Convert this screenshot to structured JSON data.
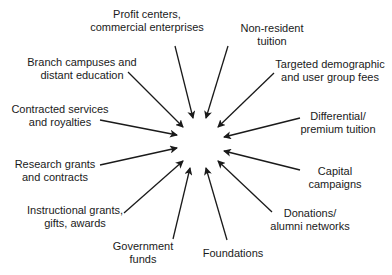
{
  "diagram": {
    "type": "radial-convergence",
    "center": {
      "x": 200,
      "y": 143
    },
    "arrow_color": "#1a1a1a",
    "sources": [
      {
        "id": "profit",
        "lines": [
          "Profit centers,",
          "commercial enterprises"
        ],
        "x": 147,
        "y": 8,
        "arrow": {
          "x1": 175,
          "y1": 46,
          "x2": 193,
          "y2": 118
        }
      },
      {
        "id": "nonresident",
        "lines": [
          "Non-resident",
          "tuition"
        ],
        "x": 272,
        "y": 22,
        "arrow": {
          "x1": 228,
          "y1": 46,
          "x2": 206,
          "y2": 118
        }
      },
      {
        "id": "branch",
        "lines": [
          "Branch campuses and",
          "distant education"
        ],
        "x": 82,
        "y": 56,
        "arrow": {
          "x1": 128,
          "y1": 72,
          "x2": 183,
          "y2": 127
        }
      },
      {
        "id": "targeted",
        "lines": [
          "Targeted demographic",
          "and user group fees"
        ],
        "x": 330,
        "y": 58,
        "arrow": {
          "x1": 274,
          "y1": 73,
          "x2": 218,
          "y2": 127
        }
      },
      {
        "id": "contracted",
        "lines": [
          "Contracted services",
          "and royalties"
        ],
        "x": 60,
        "y": 103,
        "arrow": {
          "x1": 100,
          "y1": 120,
          "x2": 177,
          "y2": 135
        }
      },
      {
        "id": "differential",
        "lines": [
          "Differential/",
          "premium tuition"
        ],
        "x": 338,
        "y": 110,
        "arrow": {
          "x1": 300,
          "y1": 118,
          "x2": 224,
          "y2": 137
        }
      },
      {
        "id": "research",
        "lines": [
          "Research grants",
          "and contracts"
        ],
        "x": 55,
        "y": 158,
        "arrow": {
          "x1": 100,
          "y1": 165,
          "x2": 177,
          "y2": 148
        }
      },
      {
        "id": "capital",
        "lines": [
          "Capital",
          "campaigns"
        ],
        "x": 335,
        "y": 165,
        "arrow": {
          "x1": 300,
          "y1": 170,
          "x2": 224,
          "y2": 151
        }
      },
      {
        "id": "instructional",
        "lines": [
          "Instructional grants,",
          "gifts, awards"
        ],
        "x": 75,
        "y": 204,
        "arrow": {
          "x1": 124,
          "y1": 213,
          "x2": 183,
          "y2": 161
        }
      },
      {
        "id": "donations",
        "lines": [
          "Donations/",
          "alumni networks"
        ],
        "x": 310,
        "y": 207,
        "arrow": {
          "x1": 272,
          "y1": 212,
          "x2": 218,
          "y2": 161
        }
      },
      {
        "id": "government",
        "lines": [
          "Government",
          "funds"
        ],
        "x": 143,
        "y": 240,
        "arrow": {
          "x1": 173,
          "y1": 239,
          "x2": 190,
          "y2": 168
        }
      },
      {
        "id": "foundations",
        "lines": [
          "Foundations"
        ],
        "x": 233,
        "y": 247,
        "arrow": {
          "x1": 227,
          "y1": 240,
          "x2": 206,
          "y2": 168
        }
      }
    ]
  }
}
